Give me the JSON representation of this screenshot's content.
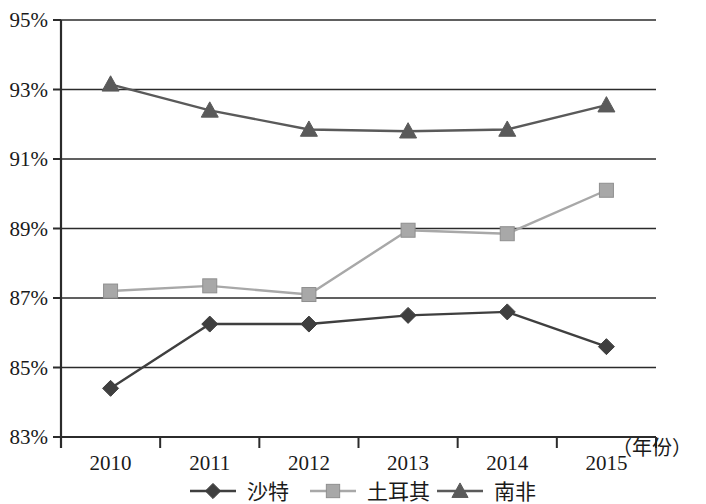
{
  "chart_data": {
    "type": "line",
    "title": "",
    "xlabel": "（年份）",
    "ylabel": "",
    "categories": [
      "2010",
      "2011",
      "2012",
      "2013",
      "2014",
      "2015"
    ],
    "ylim": [
      83,
      95
    ],
    "yticks": [
      83,
      85,
      87,
      89,
      91,
      93,
      95
    ],
    "ytick_labels": [
      "83%",
      "85%",
      "87%",
      "89%",
      "91%",
      "93%",
      "95%"
    ],
    "grid": true,
    "legend_position": "bottom",
    "series": [
      {
        "name": "沙特",
        "marker": "diamond",
        "color": "#3f3f3f",
        "values": [
          84.4,
          86.25,
          86.25,
          86.5,
          86.6,
          85.6
        ]
      },
      {
        "name": "土耳其",
        "marker": "square",
        "color": "#a8a8a8",
        "values": [
          87.2,
          87.35,
          87.1,
          88.95,
          88.85,
          90.1
        ]
      },
      {
        "name": "南非",
        "marker": "triangle",
        "color": "#5a5a5a",
        "values": [
          93.15,
          92.4,
          91.85,
          91.8,
          91.85,
          92.55
        ]
      }
    ]
  },
  "axis": {
    "x_caption": "（年份）"
  },
  "legend": {
    "items": [
      {
        "label": "沙特",
        "marker": "diamond-marker",
        "color": "#3f3f3f"
      },
      {
        "label": "土耳其",
        "marker": "square-marker",
        "color": "#a8a8a8"
      },
      {
        "label": "南非",
        "marker": "triangle-marker",
        "color": "#5a5a5a"
      }
    ]
  }
}
